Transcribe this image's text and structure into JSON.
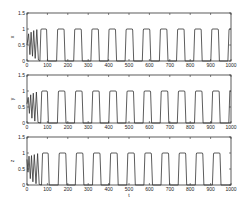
{
  "chart_data": [
    {
      "type": "line",
      "title": "",
      "ylabel": "x",
      "xlabel": "",
      "xlim": [
        0,
        1000
      ],
      "ylim": [
        0,
        1.5
      ],
      "xticks": [
        0,
        100,
        200,
        300,
        400,
        500,
        600,
        700,
        800,
        900,
        1000
      ],
      "yticks": [
        0,
        0.5,
        1,
        1.5
      ],
      "grid": false,
      "transient": [
        [
          0,
          0.5
        ],
        [
          8,
          0.85
        ],
        [
          14,
          0.2
        ],
        [
          20,
          0.9
        ],
        [
          27,
          0.15
        ],
        [
          33,
          0.95
        ],
        [
          40,
          0.08
        ],
        [
          48,
          0.98
        ],
        [
          56,
          0.03
        ]
      ],
      "pulses": [
        {
          "start": 68,
          "end": 96
        },
        {
          "start": 150,
          "end": 182
        },
        {
          "start": 234,
          "end": 266
        },
        {
          "start": 318,
          "end": 350
        },
        {
          "start": 402,
          "end": 434
        },
        {
          "start": 486,
          "end": 518
        },
        {
          "start": 570,
          "end": 602
        },
        {
          "start": 654,
          "end": 686
        },
        {
          "start": 738,
          "end": 770
        },
        {
          "start": 822,
          "end": 854
        },
        {
          "start": 906,
          "end": 938
        },
        {
          "start": 990,
          "end": 1000
        }
      ],
      "pulse_high": 1,
      "pulse_low": 0
    },
    {
      "type": "line",
      "title": "",
      "ylabel": "y",
      "xlabel": "",
      "xlim": [
        0,
        1000
      ],
      "ylim": [
        0,
        1.5
      ],
      "xticks": [
        0,
        100,
        200,
        300,
        400,
        500,
        600,
        700,
        800,
        900,
        1000
      ],
      "yticks": [
        0,
        0.5,
        1,
        1.5
      ],
      "grid": false,
      "transient": [
        [
          0,
          0.6
        ],
        [
          6,
          0.8
        ],
        [
          12,
          0.3
        ],
        [
          18,
          0.88
        ],
        [
          24,
          0.15
        ],
        [
          31,
          0.93
        ],
        [
          38,
          0.06
        ],
        [
          46,
          0.97
        ],
        [
          54,
          0.02
        ]
      ],
      "pulses": [
        {
          "start": 72,
          "end": 100
        },
        {
          "start": 154,
          "end": 186
        },
        {
          "start": 238,
          "end": 270
        },
        {
          "start": 322,
          "end": 354
        },
        {
          "start": 406,
          "end": 438
        },
        {
          "start": 490,
          "end": 522
        },
        {
          "start": 574,
          "end": 606
        },
        {
          "start": 658,
          "end": 690
        },
        {
          "start": 742,
          "end": 774
        },
        {
          "start": 826,
          "end": 858
        },
        {
          "start": 910,
          "end": 942
        },
        {
          "start": 994,
          "end": 1000
        }
      ],
      "pulse_high": 1,
      "pulse_low": 0
    },
    {
      "type": "line",
      "title": "",
      "ylabel": "z",
      "xlabel": "t",
      "xlim": [
        0,
        1000
      ],
      "ylim": [
        0,
        1.5
      ],
      "xticks": [
        0,
        100,
        200,
        300,
        400,
        500,
        600,
        700,
        800,
        900,
        1000
      ],
      "yticks": [
        0,
        0.5,
        1,
        1.5
      ],
      "grid": false,
      "transient": [
        [
          0,
          0.8
        ],
        [
          5,
          0.4
        ],
        [
          10,
          0.9
        ],
        [
          16,
          0.2
        ],
        [
          22,
          0.92
        ],
        [
          29,
          0.1
        ],
        [
          36,
          0.95
        ],
        [
          44,
          0.04
        ],
        [
          52,
          0.98
        ],
        [
          60,
          0.02
        ]
      ],
      "pulses": [
        {
          "start": 76,
          "end": 104
        },
        {
          "start": 158,
          "end": 190
        },
        {
          "start": 242,
          "end": 274
        },
        {
          "start": 326,
          "end": 358
        },
        {
          "start": 410,
          "end": 442
        },
        {
          "start": 494,
          "end": 526
        },
        {
          "start": 578,
          "end": 610
        },
        {
          "start": 662,
          "end": 694
        },
        {
          "start": 746,
          "end": 778
        },
        {
          "start": 830,
          "end": 862
        },
        {
          "start": 914,
          "end": 946
        }
      ],
      "pulse_high": 1,
      "pulse_low": 0
    }
  ],
  "figure": {
    "line_color": "#333333",
    "axes_color": "#333333",
    "background": "#ffffff"
  }
}
